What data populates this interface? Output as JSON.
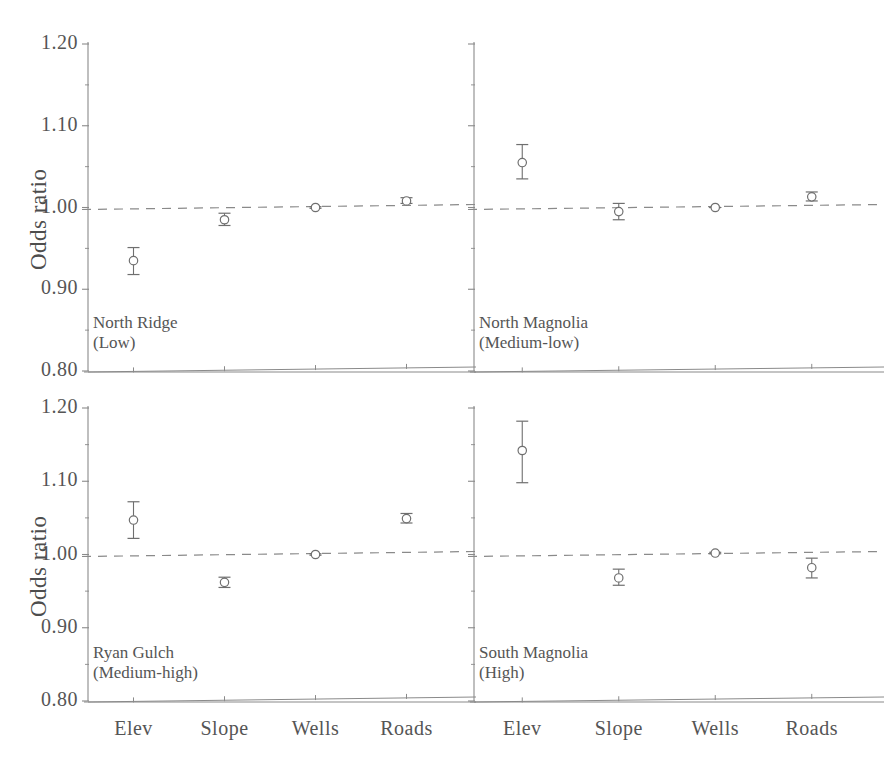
{
  "figure": {
    "y_axis_label": "Odds ratio",
    "y_ticks": [
      "1.20",
      "1.10",
      "1.00",
      "0.90",
      "0.80"
    ],
    "x_ticks": [
      "Elev",
      "Slope",
      "Wells",
      "Roads"
    ],
    "reference_line_value": "1.00",
    "line_color": "#8a8a8a",
    "marker_color": "#6f6f6f",
    "text_color": "#555555"
  },
  "panels": [
    {
      "id": "north-ridge",
      "caption_line1": "North Ridge",
      "caption_line2": "(Low)"
    },
    {
      "id": "north-magnolia",
      "caption_line1": "North Magnolia",
      "caption_line2": "(Medium-low)"
    },
    {
      "id": "ryan-gulch",
      "caption_line1": "Ryan Gulch",
      "caption_line2": "(Medium-high)"
    },
    {
      "id": "south-magnolia",
      "caption_line1": "South Magnolia",
      "caption_line2": "(High)"
    }
  ],
  "chart_data": {
    "type": "scatter",
    "title": "",
    "xlabel": "",
    "ylabel": "Odds ratio",
    "ylim": [
      0.8,
      1.2
    ],
    "yticks": [
      0.8,
      0.9,
      1.0,
      1.1,
      1.2
    ],
    "minor_ticks": true,
    "grid": false,
    "legend": "none",
    "reference_line": 1.0,
    "reference_line_style": "dashed",
    "categories": [
      "Elev",
      "Slope",
      "Wells",
      "Roads"
    ],
    "panels": [
      {
        "name": "North Ridge (Low)",
        "label": "North Ridge",
        "sublabel": "(Low)",
        "values": [
          0.935,
          0.985,
          1.0,
          1.008
        ],
        "ci_low": [
          0.918,
          0.978,
          0.999,
          1.005
        ],
        "ci_high": [
          0.951,
          0.993,
          1.001,
          1.012
        ]
      },
      {
        "name": "North Magnolia (Medium-low)",
        "label": "North Magnolia",
        "sublabel": "(Medium-low)",
        "values": [
          1.055,
          0.995,
          1.0,
          1.013
        ],
        "ci_low": [
          1.035,
          0.985,
          1.0,
          1.008
        ],
        "ci_high": [
          1.077,
          1.005,
          1.0,
          1.019
        ]
      },
      {
        "name": "Ryan Gulch (Medium-high)",
        "label": "Ryan Gulch",
        "sublabel": "(Medium-high)",
        "values": [
          1.047,
          0.962,
          1.0,
          1.049
        ],
        "ci_low": [
          1.022,
          0.955,
          0.999,
          1.043
        ],
        "ci_high": [
          1.072,
          0.969,
          1.001,
          1.056
        ]
      },
      {
        "name": "South Magnolia (High)",
        "label": "South Magnolia",
        "sublabel": "(High)",
        "values": [
          1.142,
          0.968,
          1.002,
          0.982
        ],
        "ci_low": [
          1.098,
          0.958,
          1.001,
          0.968
        ],
        "ci_high": [
          1.182,
          0.98,
          1.003,
          0.995
        ]
      }
    ]
  }
}
